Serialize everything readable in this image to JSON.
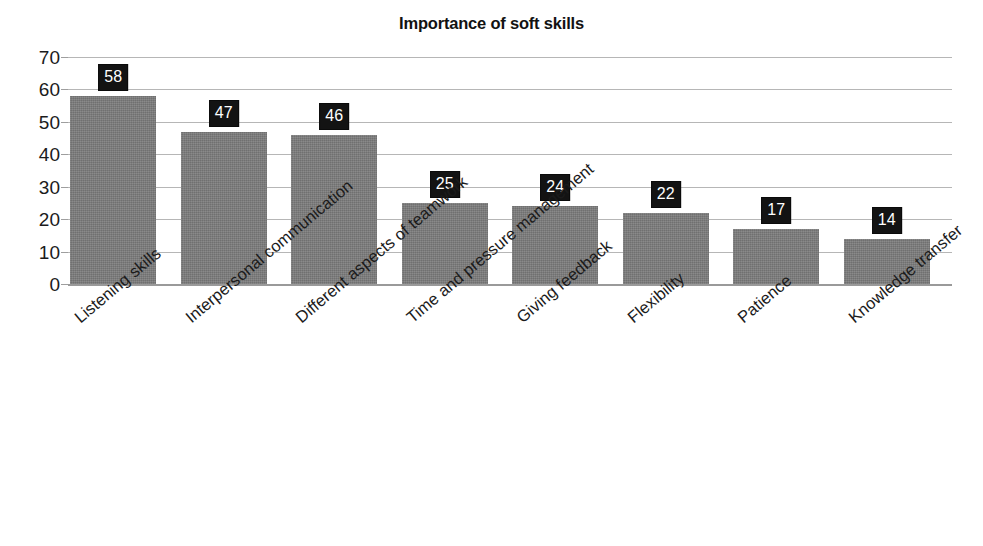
{
  "chart_data": {
    "type": "bar",
    "title": "Importance of soft skills",
    "xlabel": "",
    "ylabel": "",
    "ylim": [
      0,
      70
    ],
    "ytick_step": 10,
    "yticks": [
      "0",
      "10",
      "20",
      "30",
      "40",
      "50",
      "60",
      "70"
    ],
    "grid": true,
    "legend": false,
    "orientation": "vertical",
    "bar_color": "#7c7c7c",
    "data_label_bg": "#131313",
    "data_label_color": "#ffffff",
    "gridline_color": "#b6b6b6",
    "background": "#ffffff",
    "categories": [
      "Listening skills",
      "Interpersonal communication",
      "Different aspects of teamwork",
      "Time and pressure management",
      "Giving feedback",
      "Flexibility",
      "Patience",
      "Knowledge transfer"
    ],
    "values": [
      58,
      47,
      46,
      25,
      24,
      22,
      17,
      14
    ],
    "data_labels": [
      "58",
      "47",
      "46",
      "25",
      "24",
      "22",
      "17",
      "14"
    ]
  }
}
